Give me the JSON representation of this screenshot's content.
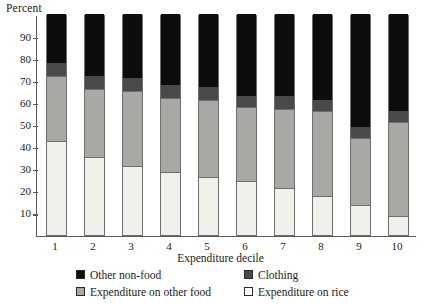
{
  "chart_data": {
    "type": "bar",
    "stacked": true,
    "title": "",
    "ylabel": "Percent",
    "xlabel": "Expenditure decile",
    "categories": [
      "1",
      "2",
      "3",
      "4",
      "5",
      "6",
      "7",
      "8",
      "9",
      "10"
    ],
    "ylim": [
      0,
      100
    ],
    "yticks": [
      10,
      20,
      30,
      40,
      50,
      60,
      70,
      80,
      90
    ],
    "grid": false,
    "legend_position": "bottom",
    "series": [
      {
        "name": "Expenditure on rice",
        "color": "#f1f0ea",
        "values": [
          42,
          35,
          31,
          28,
          26,
          24,
          21,
          17,
          13,
          8
        ]
      },
      {
        "name": "Expenditure on other food",
        "color": "#a8a8a4",
        "values": [
          30,
          31,
          34,
          34,
          35,
          34,
          36,
          39,
          31,
          43
        ]
      },
      {
        "name": "Clothing",
        "color": "#4a4a4a",
        "values": [
          6,
          6,
          6,
          6,
          6,
          5,
          6,
          5,
          5,
          5
        ]
      },
      {
        "name": "Other non-food",
        "color": "#0d0d0d",
        "values": [
          22,
          28,
          29,
          32,
          33,
          37,
          37,
          39,
          51,
          44
        ]
      }
    ]
  },
  "axes": {
    "y_title": "Percent",
    "x_title": "Expenditure decile"
  },
  "legend": {
    "entries": [
      {
        "label": "Other non-food",
        "swatch": "black-swatch"
      },
      {
        "label": "Clothing",
        "swatch": "dark-gray-swatch"
      },
      {
        "label": "Expenditure on other food",
        "swatch": "medium-gray-swatch"
      },
      {
        "label": "Expenditure on rice",
        "swatch": "white-swatch"
      }
    ]
  }
}
